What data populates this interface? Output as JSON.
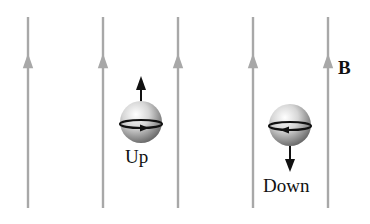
{
  "field_label": "B",
  "field_lines": [
    {
      "x": 28,
      "direction": "up"
    },
    {
      "x": 103,
      "direction": "up"
    },
    {
      "x": 178,
      "direction": "up"
    },
    {
      "x": 253,
      "direction": "up"
    },
    {
      "x": 328,
      "direction": "up"
    }
  ],
  "particles": [
    {
      "label": "Up",
      "spin": "up",
      "rotation": "counterclockwise-front-right"
    },
    {
      "label": "Down",
      "spin": "down",
      "rotation": "front-left"
    }
  ],
  "colors": {
    "field_line": "#a8a8a8",
    "sphere_dark": "#6a6a6a",
    "sphere_light": "#f2f2f2",
    "ink": "#111111"
  }
}
